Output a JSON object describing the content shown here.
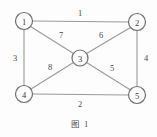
{
  "figure": {
    "caption": "图 1",
    "caption_x": 80,
    "caption_y": 124
  },
  "chart_data": {
    "type": "diagram",
    "diagram_kind": "weighted-undirected-graph",
    "title": "图 1",
    "background_color": "#fdfdfd",
    "node_stroke_color": "#6e6e6e",
    "edge_stroke_color": "#9a9a9a",
    "label_color": "#4a4a4a",
    "nodes": [
      {
        "id": "1",
        "label": "1",
        "x": 24,
        "y": 21,
        "r": 8.5
      },
      {
        "id": "2",
        "label": "2",
        "x": 137,
        "y": 22,
        "r": 8.5
      },
      {
        "id": "3",
        "label": "3",
        "x": 80,
        "y": 58,
        "r": 8.0
      },
      {
        "id": "4",
        "label": "4",
        "x": 24,
        "y": 94,
        "r": 8.5
      },
      {
        "id": "5",
        "label": "5",
        "x": 137,
        "y": 95,
        "r": 8.5
      }
    ],
    "edges": [
      {
        "from": "1",
        "to": "2",
        "weight": "1",
        "x1": 32.5,
        "y1": 21,
        "x2": 128.5,
        "y2": 22,
        "lx": 80,
        "ly": 13
      },
      {
        "from": "1",
        "to": "4",
        "weight": "3",
        "x1": 24,
        "y1": 29.5,
        "x2": 24,
        "y2": 85.5,
        "lx": 15,
        "ly": 58
      },
      {
        "from": "2",
        "to": "5",
        "weight": "4",
        "x1": 137,
        "y1": 30.5,
        "x2": 137,
        "y2": 86.5,
        "lx": 146,
        "ly": 58
      },
      {
        "from": "4",
        "to": "5",
        "weight": "2",
        "x1": 32.5,
        "y1": 94,
        "x2": 128.5,
        "y2": 95,
        "lx": 80,
        "ly": 104
      },
      {
        "from": "1",
        "to": "3",
        "weight": "7",
        "x1": 30.5,
        "y1": 26.5,
        "x2": 73.5,
        "y2": 53.5,
        "lx": 61,
        "ly": 35
      },
      {
        "from": "2",
        "to": "3",
        "weight": "6",
        "x1": 130.5,
        "y1": 27.5,
        "x2": 86.5,
        "y2": 53.5,
        "lx": 101,
        "ly": 35
      },
      {
        "from": "4",
        "to": "3",
        "weight": "8",
        "x1": 31,
        "y1": 89,
        "x2": 73.5,
        "y2": 62.5,
        "lx": 50,
        "ly": 67
      },
      {
        "from": "5",
        "to": "3",
        "weight": "5",
        "x1": 130.5,
        "y1": 90,
        "x2": 86.5,
        "y2": 62.5,
        "lx": 112,
        "ly": 68
      }
    ]
  }
}
